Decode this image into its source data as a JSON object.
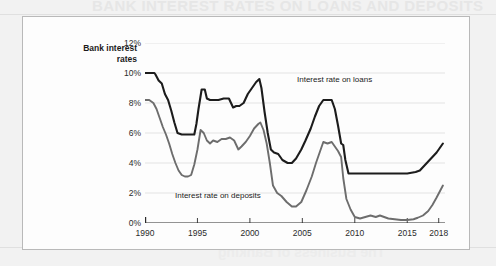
{
  "page": {
    "ghost_text_top": "BANK INTEREST RATES ON LOANS AND DEPOSITS",
    "ghost_text_bottom": "The Business of Banking"
  },
  "figure": {
    "axis_title_line1": "Bank interest",
    "axis_title_line2": "rates"
  },
  "chart_data": {
    "type": "line",
    "title": "",
    "xlabel": "",
    "ylabel": "Bank interest rates",
    "xlim": [
      1990,
      2018.6
    ],
    "ylim": [
      0,
      12
    ],
    "grid": true,
    "legend_position": "inline-annotation",
    "ytick_labels": [
      "0%",
      "2%",
      "4%",
      "6%",
      "8%",
      "10%",
      "12%"
    ],
    "ytick_values": [
      0,
      2,
      4,
      6,
      8,
      10,
      12
    ],
    "xtick_labels": [
      "1990",
      "1995",
      "2000",
      "2005",
      "2010",
      "2015",
      "2018"
    ],
    "xtick_values": [
      1990,
      1995,
      2000,
      2005,
      2010,
      2015,
      2018
    ],
    "series": [
      {
        "name": "Interest rate on loans",
        "color": "#1c1c1c",
        "label_text": "Interest rate on loans",
        "x": [
          1990.0,
          1990.5,
          1990.9,
          1991.0,
          1991.3,
          1991.6,
          1991.9,
          1992.2,
          1992.5,
          1992.8,
          1993.1,
          1993.5,
          1993.9,
          1994.3,
          1994.7,
          1994.9,
          1995.1,
          1995.4,
          1995.7,
          1995.9,
          1996.2,
          1996.6,
          1997.0,
          1997.5,
          1998.0,
          1998.4,
          1998.7,
          1999.0,
          1999.4,
          1999.8,
          2000.2,
          2000.6,
          2000.9,
          2001.1,
          2001.4,
          2001.7,
          2002.0,
          2002.3,
          2002.7,
          2003.1,
          2003.6,
          2004.0,
          2004.4,
          2004.9,
          2005.3,
          2005.8,
          2006.2,
          2006.6,
          2007.0,
          2007.4,
          2007.8,
          2008.1,
          2008.4,
          2008.7,
          2008.9,
          2009.1,
          2009.4,
          2010.0,
          2011.0,
          2012.0,
          2013.0,
          2014.0,
          2015.0,
          2015.8,
          2016.2,
          2016.6,
          2017.0,
          2017.4,
          2017.8,
          2018.1,
          2018.4
        ],
        "y": [
          10.0,
          10.0,
          10.0,
          9.9,
          9.5,
          9.3,
          8.6,
          8.2,
          7.5,
          6.7,
          6.0,
          5.9,
          5.9,
          5.9,
          5.9,
          6.6,
          7.6,
          8.9,
          8.9,
          8.3,
          8.2,
          8.2,
          8.2,
          8.3,
          8.3,
          7.7,
          7.8,
          7.8,
          8.0,
          8.6,
          9.0,
          9.4,
          9.6,
          9.0,
          7.4,
          6.0,
          4.9,
          4.7,
          4.6,
          4.2,
          4.0,
          4.0,
          4.3,
          4.9,
          5.5,
          6.3,
          7.1,
          7.8,
          8.2,
          8.2,
          8.2,
          7.6,
          6.5,
          5.3,
          5.2,
          4.2,
          3.3,
          3.3,
          3.3,
          3.3,
          3.3,
          3.3,
          3.3,
          3.4,
          3.5,
          3.8,
          4.1,
          4.4,
          4.7,
          5.0,
          5.3
        ]
      },
      {
        "name": "Interest rate on deposits",
        "color": "#6d6d6d",
        "label_text": "Interest rate on deposits",
        "x": [
          1990.0,
          1990.4,
          1990.8,
          1991.1,
          1991.4,
          1991.7,
          1992.0,
          1992.3,
          1992.6,
          1992.9,
          1993.2,
          1993.5,
          1993.8,
          1994.1,
          1994.4,
          1994.7,
          1995.0,
          1995.3,
          1995.6,
          1995.9,
          1996.2,
          1996.5,
          1996.9,
          1997.3,
          1997.7,
          1998.1,
          1998.5,
          1998.9,
          1999.2,
          1999.6,
          2000.0,
          2000.4,
          2000.8,
          2001.0,
          2001.3,
          2001.6,
          2001.9,
          2002.2,
          2002.6,
          2003.0,
          2003.5,
          2004.0,
          2004.4,
          2004.9,
          2005.4,
          2005.9,
          2006.3,
          2006.7,
          2007.0,
          2007.4,
          2007.8,
          2008.1,
          2008.4,
          2008.7,
          2008.9,
          2009.2,
          2009.6,
          2010.0,
          2010.5,
          2011.0,
          2011.5,
          2012.0,
          2012.4,
          2012.8,
          2013.2,
          2013.8,
          2014.4,
          2015.0,
          2015.6,
          2016.0,
          2016.5,
          2017.0,
          2017.4,
          2017.8,
          2018.1,
          2018.4
        ],
        "y": [
          8.2,
          8.2,
          8.0,
          7.6,
          7.0,
          6.4,
          5.9,
          5.3,
          4.6,
          4.0,
          3.5,
          3.2,
          3.1,
          3.1,
          3.2,
          3.9,
          4.9,
          6.2,
          6.0,
          5.5,
          5.3,
          5.5,
          5.4,
          5.6,
          5.6,
          5.7,
          5.5,
          4.9,
          5.1,
          5.4,
          5.8,
          6.3,
          6.6,
          6.7,
          6.2,
          5.3,
          4.0,
          2.5,
          2.0,
          1.8,
          1.4,
          1.1,
          1.1,
          1.4,
          2.2,
          3.1,
          4.0,
          4.8,
          5.4,
          5.3,
          5.4,
          5.1,
          4.8,
          4.4,
          3.0,
          1.6,
          0.9,
          0.4,
          0.3,
          0.4,
          0.5,
          0.4,
          0.5,
          0.4,
          0.3,
          0.25,
          0.2,
          0.2,
          0.25,
          0.35,
          0.5,
          0.8,
          1.2,
          1.7,
          2.1,
          2.5
        ]
      }
    ]
  }
}
